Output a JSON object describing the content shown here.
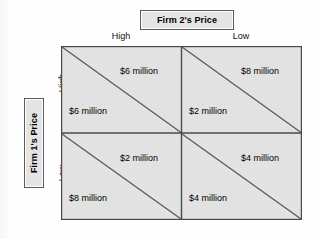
{
  "figure": {
    "type": "payoff-matrix",
    "column_header_title": "Firm 2's Price",
    "row_header_title": "Firm 1's Price",
    "column_labels": [
      "High",
      "Low"
    ],
    "row_labels": [
      "High",
      "Low"
    ],
    "cells": [
      {
        "row": "High",
        "column": "High",
        "upper_right_payoff": "$6 million",
        "lower_left_payoff": "$6 million"
      },
      {
        "row": "High",
        "column": "Low",
        "upper_right_payoff": "$8 million",
        "lower_left_payoff": "$2 million"
      },
      {
        "row": "Low",
        "column": "High",
        "upper_right_payoff": "$2 million",
        "lower_left_payoff": "$8 million"
      },
      {
        "row": "Low",
        "column": "Low",
        "upper_right_payoff": "$4 million",
        "lower_left_payoff": "$4 million"
      }
    ]
  },
  "colors": {
    "cell_fill": "#e2e2e2",
    "grid_line": "#4a4a4a",
    "diagonal_line": "#5a5a5a",
    "header_box_fill": "#e4e4e4",
    "header_box_border": "#5a5a5a",
    "page_background": "#ffffff"
  }
}
